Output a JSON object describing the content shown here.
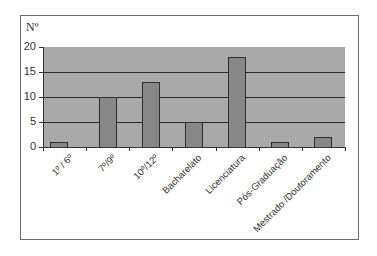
{
  "chart_data": {
    "type": "bar",
    "title": "",
    "xlabel": "",
    "ylabel": "Nº",
    "ylim": [
      0,
      20
    ],
    "yticks": [
      0,
      5,
      10,
      15,
      20
    ],
    "grid": true,
    "legend": null,
    "categories": [
      "1º / 6º",
      "7º/9º",
      "10º/12º",
      "Bacharelato",
      "Licenciatura",
      "Pós-Graduação",
      "Mestrado /Doutoramento"
    ],
    "values": [
      1,
      10,
      13,
      5,
      18,
      1,
      2
    ]
  },
  "colors": {
    "plot_background": "#a9a9a9",
    "bar_fill": "#878787",
    "bar_outline": "#2e2e2e",
    "gridline": "#2a2a2a"
  },
  "ytick_labels": [
    "0",
    "5",
    "10",
    "15",
    "20"
  ]
}
